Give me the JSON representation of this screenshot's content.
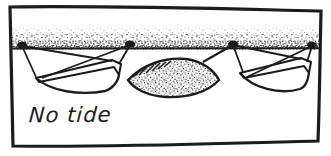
{
  "figure": {
    "caption": "No tide"
  },
  "colors": {
    "ink": "#1c1c1c",
    "paper": "#ffffff",
    "stipple": "#262626"
  },
  "icons": {
    "bollard": "filled-oval-dot"
  },
  "counts": {
    "bollards": 4,
    "boats": 3
  }
}
